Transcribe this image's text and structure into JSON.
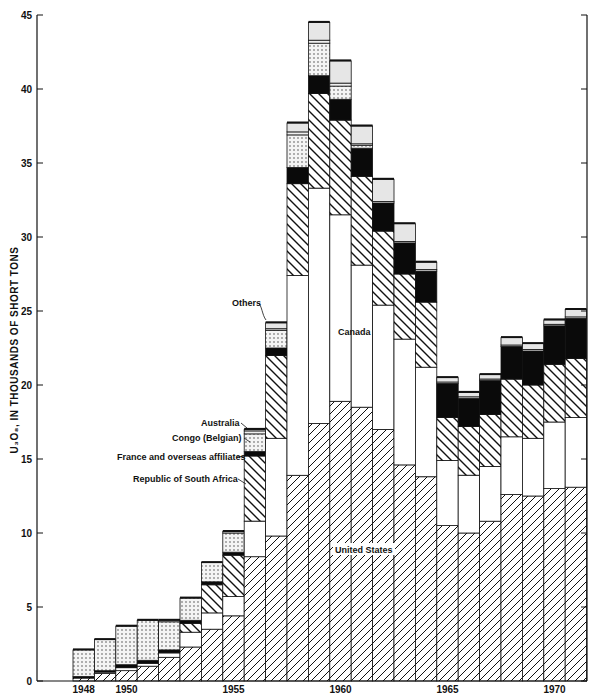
{
  "chart_data": {
    "type": "bar",
    "stacked": true,
    "title": "",
    "xlabel": "",
    "ylabel": "U3O8, IN THOUSANDS OF SHORT TONS",
    "ylim": [
      0,
      45
    ],
    "yticks": [
      0,
      5,
      10,
      15,
      20,
      25,
      30,
      35,
      40,
      45
    ],
    "xtick_labels": [
      "1948",
      "1950",
      "1955",
      "1960",
      "1965",
      "1970"
    ],
    "grid": false,
    "legend_position": "inline annotations",
    "categories": [
      "1948",
      "1949",
      "1950",
      "1951",
      "1952",
      "1953",
      "1954",
      "1955",
      "1956",
      "1957",
      "1958",
      "1959",
      "1960",
      "1961",
      "1962",
      "1963",
      "1964",
      "1965",
      "1966",
      "1967",
      "1968",
      "1969",
      "1970",
      "1971"
    ],
    "series": [
      {
        "name": "United States",
        "pattern": "forward-hatch",
        "values": [
          0.2,
          0.5,
          0.7,
          1.0,
          1.6,
          2.3,
          3.5,
          4.4,
          8.4,
          9.8,
          13.9,
          17.4,
          18.9,
          18.5,
          17.0,
          14.6,
          13.8,
          10.5,
          10.0,
          10.8,
          12.6,
          12.5,
          13.0,
          13.1
        ]
      },
      {
        "name": "Canada",
        "pattern": "white",
        "values": [
          0.0,
          0.1,
          0.2,
          0.2,
          0.3,
          1.0,
          1.1,
          1.3,
          2.4,
          6.6,
          13.5,
          15.9,
          12.6,
          9.6,
          8.4,
          8.5,
          7.4,
          4.4,
          3.9,
          3.7,
          3.9,
          3.9,
          4.5,
          4.7
        ]
      },
      {
        "name": "Republic of South Africa",
        "pattern": "back-hatch",
        "values": [
          0.0,
          0.0,
          0.0,
          0.0,
          0.0,
          0.6,
          1.9,
          2.8,
          4.4,
          5.6,
          6.2,
          6.4,
          6.4,
          6.0,
          5.0,
          4.4,
          4.4,
          2.9,
          3.3,
          3.5,
          3.9,
          3.6,
          3.9,
          4.0
        ]
      },
      {
        "name": "France and overseas affiliates",
        "pattern": "solid-black",
        "values": [
          0.1,
          0.1,
          0.2,
          0.2,
          0.2,
          0.2,
          0.2,
          0.2,
          0.3,
          0.5,
          1.1,
          1.2,
          1.4,
          1.9,
          1.9,
          2.1,
          2.1,
          2.3,
          1.9,
          2.3,
          2.2,
          2.3,
          2.6,
          2.7
        ]
      },
      {
        "name": "Congo (Belgian)",
        "pattern": "dotted",
        "values": [
          1.8,
          2.1,
          2.6,
          2.7,
          1.9,
          1.5,
          1.3,
          1.3,
          1.2,
          1.2,
          2.2,
          2.2,
          0.9,
          0.2,
          0.0,
          0.0,
          0.0,
          0.0,
          0.0,
          0.0,
          0.0,
          0.0,
          0.0,
          0.0
        ]
      },
      {
        "name": "Australia",
        "pattern": "light-band",
        "values": [
          0.0,
          0.0,
          0.0,
          0.0,
          0.0,
          0.0,
          0.0,
          0.0,
          0.2,
          0.1,
          0.2,
          0.2,
          0.2,
          0.1,
          0.1,
          0.1,
          0.1,
          0.1,
          0.1,
          0.1,
          0.1,
          0.1,
          0.1,
          0.1
        ]
      },
      {
        "name": "Others",
        "pattern": "light-gray",
        "values": [
          0.0,
          0.0,
          0.0,
          0.0,
          0.1,
          0.0,
          0.0,
          0.1,
          0.1,
          0.4,
          0.6,
          1.2,
          1.5,
          1.2,
          1.5,
          1.2,
          0.5,
          0.3,
          0.3,
          0.3,
          0.5,
          0.4,
          0.3,
          0.5
        ]
      }
    ],
    "annotations": [
      {
        "text": "Others",
        "target": "1957"
      },
      {
        "text": "Canada",
        "target": "1960"
      },
      {
        "text": "Australia",
        "target": "1956"
      },
      {
        "text": "Congo (Belgian)",
        "target": "1956"
      },
      {
        "text": "France and overseas affiliates",
        "target": "1956"
      },
      {
        "text": "Republic of South Africa",
        "target": "1956"
      },
      {
        "text": "United States",
        "target": "1960"
      }
    ]
  },
  "labels": {
    "ylabel_main": "U",
    "ylabel_full": "U₃O₈, IN THOUSANDS OF SHORT TONS",
    "others": "Others",
    "canada": "Canada",
    "australia": "Australia",
    "congo": "Congo (Belgian)",
    "france": "France and overseas affiliates",
    "south_africa": "Republic of South Africa",
    "united_states": "United States"
  }
}
